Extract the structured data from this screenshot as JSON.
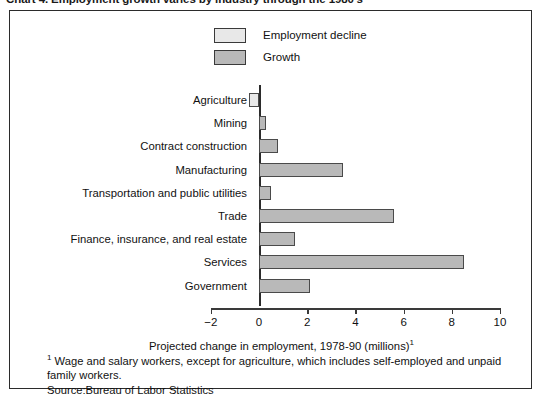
{
  "caption": "Chart 4.  Employment growth varies by industry through the 1980's",
  "legend": [
    {
      "label": "Employment decline",
      "color": "#e8e8e8",
      "key": "decline"
    },
    {
      "label": "Growth",
      "color": "#b9b9b9",
      "key": "growth"
    }
  ],
  "axis": {
    "title": "Projected change in employment, 1978-90 (millions)",
    "title_superscript": "1",
    "ticks": [
      "−2",
      "0",
      "2",
      "4",
      "6",
      "8",
      "10"
    ],
    "tick_values": [
      -2,
      0,
      2,
      4,
      6,
      8,
      10
    ]
  },
  "footnotes": {
    "marker": "1",
    "note": "Wage and salary workers, except for agriculture, which includes self-employed and  unpaid family workers.",
    "source": "Source:Bureau of Labor Statistics"
  },
  "chart_data": {
    "type": "bar",
    "orientation": "horizontal",
    "title": "Chart 4.  Employment growth varies by industry through the 1980's",
    "xlabel": "Projected change in employment, 1978-90 (millions)",
    "ylabel": "",
    "xlim": [
      -2,
      10
    ],
    "grid": false,
    "legend_position": "top-center",
    "categories": [
      "Agriculture",
      "Mining",
      "Contract construction",
      "Manufacturing",
      "Transportation and public utilities",
      "Trade",
      "Finance, insurance, and real estate",
      "Services",
      "Government"
    ],
    "values": [
      -0.4,
      0.3,
      0.8,
      3.5,
      0.5,
      5.6,
      1.5,
      8.5,
      2.1
    ],
    "series_key": [
      "decline",
      "growth",
      "growth",
      "growth",
      "growth",
      "growth",
      "growth",
      "growth",
      "growth"
    ],
    "series": [
      {
        "name": "Employment decline",
        "color": "#e8e8e8"
      },
      {
        "name": "Growth",
        "color": "#b9b9b9"
      }
    ]
  }
}
